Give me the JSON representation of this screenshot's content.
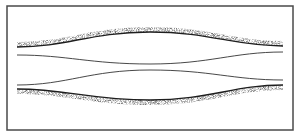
{
  "diagram": {
    "colors": {
      "background": "#ffffff",
      "border": "#4a4a4a",
      "stipple": "#2a2a2a",
      "line": "#333333"
    },
    "frame": {
      "x": 7,
      "y": 6,
      "width": 286,
      "height": 124
    },
    "upper_wall": {
      "left_y": 47,
      "center_y": 32,
      "right_y": 46
    },
    "upper_line": {
      "left_y": 55,
      "center_y": 64,
      "right_y": 52
    },
    "lower_line": {
      "left_y": 85,
      "center_y": 70,
      "right_y": 80
    },
    "lower_wall": {
      "left_y": 89,
      "center_y": 100,
      "right_y": 85
    }
  }
}
